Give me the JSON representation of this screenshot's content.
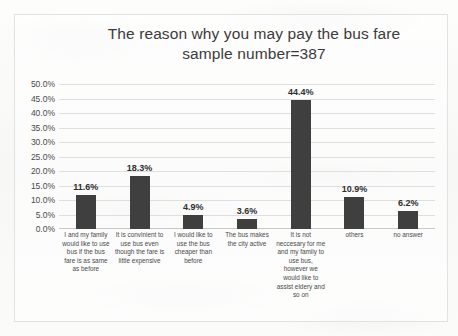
{
  "chart_data": {
    "type": "bar",
    "title": "The reason why you may pay the bus fare",
    "subtitle": "sample number=387",
    "xlabel": "",
    "ylabel": "",
    "ylim": [
      0,
      50
    ],
    "ytick_labels": [
      "50.0%",
      "45.0%",
      "40.0%",
      "35.0%",
      "30.0%",
      "25.0%",
      "20.0%",
      "15.0%",
      "10.0%",
      "5.0%",
      "0.0%"
    ],
    "ytick_values": [
      50,
      45,
      40,
      35,
      30,
      25,
      20,
      15,
      10,
      5,
      0
    ],
    "grid": true,
    "legend": "none",
    "bar_color": "#3f3f3f",
    "gridline_color": "#dfdfdf",
    "categories": [
      "I and my family would like to use bus if the bus fare is as same as before",
      "It is convinient to use bus even though the fare is little expensive",
      "I would like to use the bus cheaper than before",
      "The bus makes the city active",
      "It is not neccesary for me and my family to use bus, however we would like to assist eldery and so on",
      "others",
      "no answer"
    ],
    "values": [
      11.6,
      18.3,
      4.9,
      3.6,
      44.4,
      10.9,
      6.2
    ],
    "value_labels": [
      "11.6%",
      "18.3%",
      "4.9%",
      "3.6%",
      "44.4%",
      "10.9%",
      "6.2%"
    ]
  }
}
